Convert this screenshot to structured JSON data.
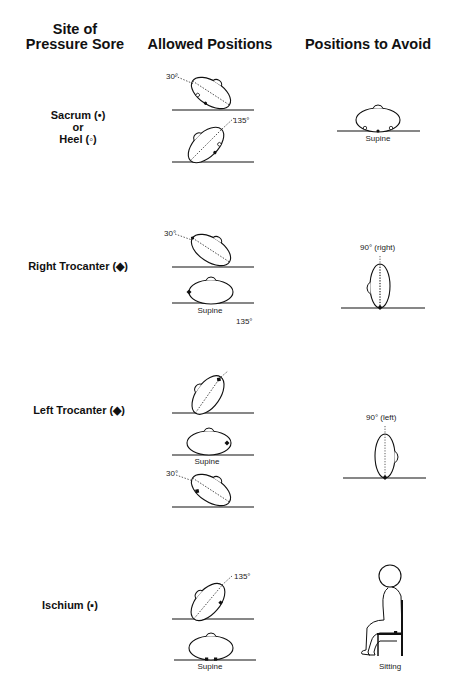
{
  "headers": {
    "site": [
      "Site of",
      "Pressure Sore"
    ],
    "allowed": "Allowed Positions",
    "avoid": "Positions to Avoid"
  },
  "rows": [
    {
      "site_lines": [
        "Sacrum (•)",
        "or",
        "Heel (◦)"
      ],
      "allowed": [
        {
          "angle_label": "30°"
        },
        {
          "angle_label": "135°"
        }
      ],
      "avoid": {
        "position_label": "Supine"
      }
    },
    {
      "site_lines": [
        "Right Trocanter (◆)"
      ],
      "allowed": [
        {
          "angle_label": "30°"
        },
        {
          "position_label": "Supine"
        }
      ],
      "extra_label": "135°",
      "avoid": {
        "angle_label": "90°  (right)"
      }
    },
    {
      "site_lines": [
        "Left Trocanter (◆)"
      ],
      "allowed": [
        {
          "angle_label": ""
        },
        {
          "position_label": "Supine"
        },
        {
          "angle_label": "30°"
        }
      ],
      "avoid": {
        "angle_label": "90°  (left)"
      }
    },
    {
      "site_lines": [
        "Ischium (▪)"
      ],
      "allowed": [
        {
          "angle_label": "135°"
        },
        {
          "position_label": "Supine"
        }
      ],
      "avoid": {
        "position_label": "Sitting"
      }
    }
  ]
}
